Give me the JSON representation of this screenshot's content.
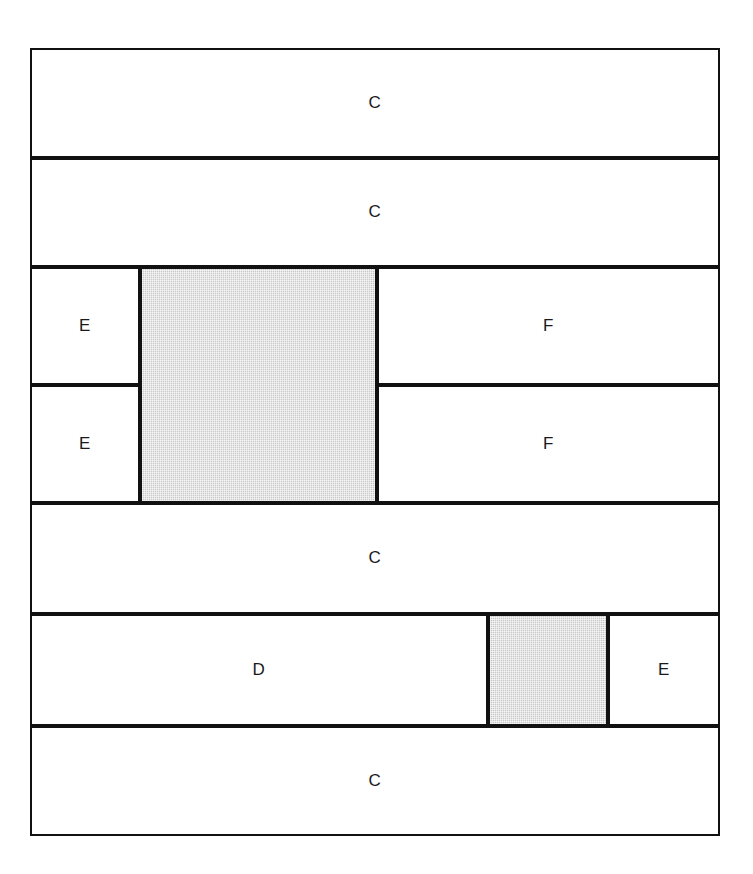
{
  "diagram": {
    "canvas": {
      "width": 753,
      "height": 874,
      "background": "#ffffff"
    },
    "frame": {
      "x": 30,
      "y": 48,
      "width": 690,
      "height": 788,
      "stroke": "#111111",
      "stroke_width": 2
    },
    "colors": {
      "stroke": "#111111",
      "plain_fill": "#ffffff",
      "shaded_fill": "#c9c9c9",
      "label_text": "#1a1a1a"
    },
    "legend_note": "Shaded rectangles are unlabeled; lettered rectangles are labeled C, D, E or F.",
    "rows": [
      {
        "name": "row-1",
        "y": 48,
        "height": 110,
        "cells": [
          {
            "name": "cell-c-1",
            "label": "C",
            "x": 30,
            "width": 690,
            "fill": "plain"
          }
        ]
      },
      {
        "name": "row-2",
        "y": 158,
        "height": 109,
        "cells": [
          {
            "name": "cell-c-2",
            "label": "C",
            "x": 30,
            "width": 690,
            "fill": "plain"
          }
        ]
      },
      {
        "name": "row-3",
        "y": 267,
        "height": 118,
        "cells": [
          {
            "name": "cell-e-1",
            "label": "E",
            "x": 30,
            "width": 110,
            "fill": "plain"
          },
          {
            "name": "cell-f-1",
            "label": "F",
            "x": 377,
            "width": 343,
            "fill": "plain"
          }
        ]
      },
      {
        "name": "row-4",
        "y": 385,
        "height": 118,
        "cells": [
          {
            "name": "cell-e-2",
            "label": "E",
            "x": 30,
            "width": 110,
            "fill": "plain"
          },
          {
            "name": "cell-f-2",
            "label": "F",
            "x": 377,
            "width": 343,
            "fill": "plain"
          }
        ]
      },
      {
        "name": "row-5",
        "y": 503,
        "height": 111,
        "cells": [
          {
            "name": "cell-c-3",
            "label": "C",
            "x": 30,
            "width": 690,
            "fill": "plain"
          }
        ]
      },
      {
        "name": "row-6",
        "y": 614,
        "height": 112,
        "cells": [
          {
            "name": "cell-d-1",
            "label": "D",
            "x": 30,
            "width": 458,
            "fill": "plain"
          },
          {
            "name": "cell-shaded-2",
            "label": "",
            "x": 488,
            "width": 120,
            "fill": "shaded"
          },
          {
            "name": "cell-e-3",
            "label": "E",
            "x": 608,
            "width": 112,
            "fill": "plain"
          }
        ]
      },
      {
        "name": "row-7",
        "y": 726,
        "height": 110,
        "cells": [
          {
            "name": "cell-c-4",
            "label": "C",
            "x": 30,
            "width": 690,
            "fill": "plain"
          }
        ]
      }
    ],
    "spanning_cells": [
      {
        "name": "cell-shaded-1",
        "label": "",
        "x": 140,
        "y": 267,
        "width": 237,
        "height": 236,
        "fill": "shaded",
        "spans_rows": [
          "row-3",
          "row-4"
        ]
      }
    ],
    "labels": {
      "c": "C",
      "d": "D",
      "e": "E",
      "f": "F"
    }
  }
}
